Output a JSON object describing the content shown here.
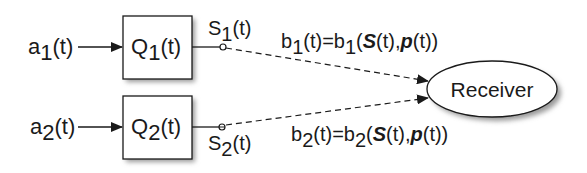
{
  "diagram": {
    "inputs": [
      {
        "base": "a",
        "sub": "1",
        "suffix": "(t)"
      },
      {
        "base": "a",
        "sub": "2",
        "suffix": "(t)"
      }
    ],
    "queues": [
      {
        "base": "Q",
        "sub": "1",
        "suffix": "(t)"
      },
      {
        "base": "Q",
        "sub": "2",
        "suffix": "(t)"
      }
    ],
    "states": [
      {
        "base": "S",
        "sub": "1",
        "suffix": "(t)"
      },
      {
        "base": "S",
        "sub": "2",
        "suffix": "(t)"
      }
    ],
    "rates": [
      {
        "b": "b",
        "sub": "1",
        "mid": "(t)=b",
        "sub2": "1",
        "open": "(",
        "S": "S",
        "t1": "(t),",
        "p": "p",
        "t2": "(t))"
      },
      {
        "b": "b",
        "sub": "2",
        "mid": "(t)=b",
        "sub2": "2",
        "open": "(",
        "S": "S",
        "t1": "(t),",
        "p": "p",
        "t2": "(t))"
      }
    ],
    "receiver": "Receiver",
    "colors": {
      "stroke": "#1a1a1a",
      "fill": "#ffffff",
      "shadow": "#9a9a9a"
    }
  }
}
